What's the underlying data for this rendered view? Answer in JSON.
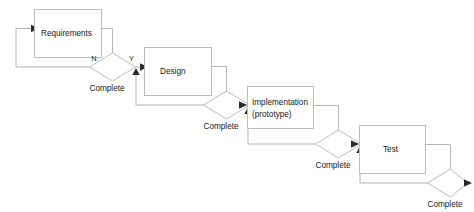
{
  "diagram": {
    "colors": {
      "box_stroke": "#bdbdbd",
      "line_stroke": "#b5b5b5",
      "arrow_fill": "#2b2b2b",
      "text": "#1a1a1a",
      "background": "#ffffff"
    },
    "stages": [
      {
        "id": "requirements",
        "box_label": "Requirements",
        "box_label_line2": "",
        "decision_label": "Complete",
        "branch_no": "N",
        "branch_yes": "Y"
      },
      {
        "id": "design",
        "box_label": "Design",
        "box_label_line2": "",
        "decision_label": "Complete",
        "branch_no": "",
        "branch_yes": ""
      },
      {
        "id": "implementation",
        "box_label": "Implementation",
        "box_label_line2": "(prototype)",
        "decision_label": "Complete",
        "branch_no": "",
        "branch_yes": ""
      },
      {
        "id": "test",
        "box_label": "Test",
        "box_label_line2": "",
        "decision_label": "Complete",
        "branch_no": "",
        "branch_yes": ""
      }
    ]
  }
}
